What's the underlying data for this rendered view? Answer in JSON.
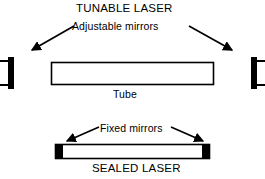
{
  "diagram": {
    "background_color": "#ffffff",
    "stroke_color": "#000000",
    "fill_color": "#ffffff",
    "tunable": {
      "title": "TUNABLE LASER",
      "mirror_label": "Adjustable mirrors",
      "tube_label": "Tube",
      "mirrors": [
        {
          "side": "left",
          "x": 8,
          "y": 57,
          "width": 6,
          "height": 32
        },
        {
          "side": "right",
          "x": 251,
          "y": 57,
          "width": 6,
          "height": 32
        }
      ],
      "tube": {
        "x": 51,
        "y": 62,
        "width": 163,
        "height": 23
      },
      "arrows": [
        {
          "from": [
            72,
            26
          ],
          "to": [
            27,
            53
          ],
          "points_to": "left-adjustable-mirror"
        },
        {
          "from": [
            190,
            26
          ],
          "to": [
            236,
            53
          ],
          "points_to": "right-adjustable-mirror"
        }
      ]
    },
    "sealed": {
      "title": "SEALED LASER",
      "mirror_label": "Fixed mirrors",
      "body": {
        "x": 55,
        "y": 144,
        "width": 155,
        "height": 15
      },
      "end_caps": [
        {
          "side": "left",
          "x": 55,
          "y": 144,
          "width": 7,
          "height": 15
        },
        {
          "side": "right",
          "x": 203,
          "y": 144,
          "width": 7,
          "height": 15
        }
      ],
      "arrows": [
        {
          "from": [
            98,
            127
          ],
          "to": [
            63,
            143
          ],
          "points_to": "left-fixed-mirror"
        },
        {
          "from": [
            172,
            127
          ],
          "to": [
            206,
            143
          ],
          "points_to": "right-fixed-mirror"
        }
      ]
    }
  }
}
